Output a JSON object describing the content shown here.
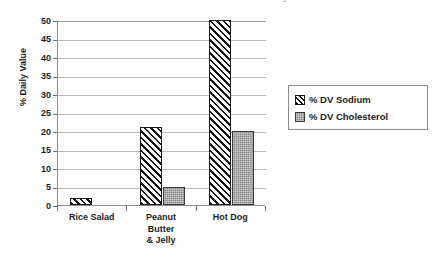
{
  "chart_data": {
    "type": "bar",
    "title": "How much salt and cholesterol is in your lunch?",
    "xlabel": "",
    "ylabel": "% Daily Value",
    "ylim": [
      0,
      50
    ],
    "ytick_step": 5,
    "yticks": [
      "50",
      "45",
      "40",
      "35",
      "30",
      "25",
      "20",
      "15",
      "10",
      "5",
      "0"
    ],
    "grid": true,
    "legend_position": "right",
    "categories": [
      "Rice Salad",
      "Peanut Butter & Jelly",
      "Hot Dog"
    ],
    "category_lines": [
      [
        "Rice Salad"
      ],
      [
        "Peanut",
        "Butter",
        "& Jelly"
      ],
      [
        "Hot Dog"
      ]
    ],
    "series": [
      {
        "name": "% DV Sodium",
        "fill": "diagonal-hatch",
        "color": "#ffffff",
        "values": [
          2,
          21,
          50
        ]
      },
      {
        "name": "% DV Cholesterol",
        "fill": "solid-gray",
        "color": "#8b8b8b",
        "values": [
          0,
          5,
          20
        ]
      }
    ]
  },
  "legend": {
    "items": [
      {
        "label": "% DV Sodium"
      },
      {
        "label": "% DV Cholesterol"
      }
    ]
  }
}
